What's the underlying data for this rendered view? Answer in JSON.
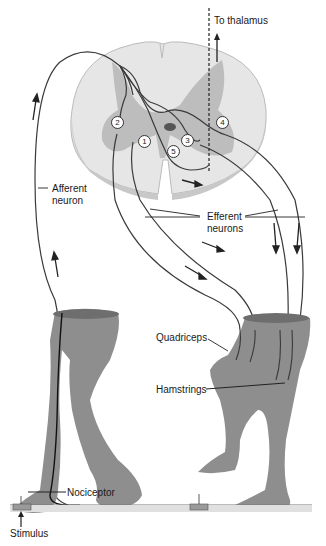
{
  "figure": {
    "labels": {
      "to_thalamus": "To thalamus",
      "afferent_line1": "Afferent",
      "afferent_line2": "neuron",
      "efferent_line1": "Efferent",
      "efferent_line2": "neurons",
      "quadriceps": "Quadriceps",
      "hamstrings": "Hamstrings",
      "nociceptor": "Nociceptor",
      "stimulus": "Stimulus"
    },
    "synapse_numbers": [
      "1",
      "2",
      "3",
      "4",
      "5"
    ],
    "colors": {
      "white_matter": "#e8e8e8",
      "gray_matter": "#bdbdbd",
      "skin": "#8a8a8a",
      "neuron_line": "#3a3a3a",
      "ground": "#888888"
    }
  }
}
